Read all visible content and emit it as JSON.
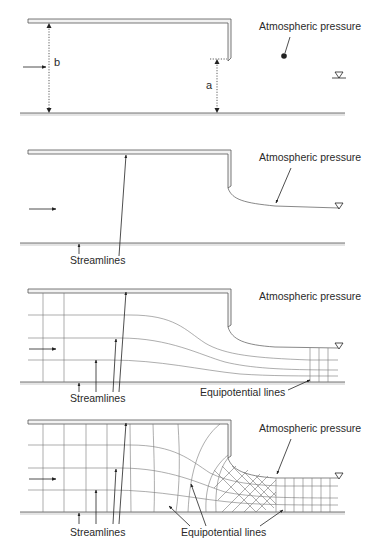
{
  "panels": [
    {
      "id": "definition",
      "labels": {
        "atmospheric_pressure": "Atmospheric pressure",
        "upstream_depth": "b",
        "gate_opening": "a"
      },
      "icons": [
        "flow-arrow-icon",
        "water-surface-symbol-icon",
        "pressure-point-icon"
      ]
    },
    {
      "id": "boundary-streamlines",
      "labels": {
        "atmospheric_pressure": "Atmospheric pressure",
        "streamlines": "Streamlines"
      },
      "icons": [
        "flow-arrow-icon",
        "water-surface-symbol-icon"
      ]
    },
    {
      "id": "streamlines-sketch",
      "labels": {
        "atmospheric_pressure": "Atmospheric pressure",
        "streamlines": "Streamlines",
        "equipotential": "Equipotential lines"
      },
      "icons": [
        "flow-arrow-icon",
        "water-surface-symbol-icon"
      ]
    },
    {
      "id": "flow-net",
      "labels": {
        "atmospheric_pressure": "Atmospheric pressure",
        "streamlines": "Streamlines",
        "equipotential": "Equipotential lines"
      },
      "icons": [
        "flow-arrow-icon",
        "water-surface-symbol-icon"
      ]
    }
  ],
  "colors": {
    "line": "#555555",
    "text": "#2a2a2a",
    "bed_shade": "#e4e4e4",
    "background": "#ffffff"
  }
}
